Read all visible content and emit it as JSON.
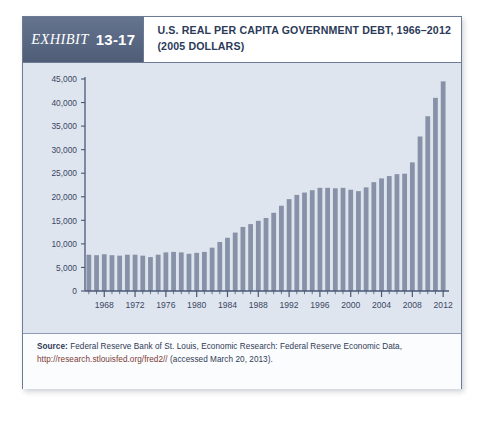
{
  "exhibit": {
    "word": "Exhibit",
    "number": "13-17"
  },
  "title": {
    "line1": "U.S. Real Per Capita Government Debt, 1966–2012",
    "line2": "(2005 Dollars)"
  },
  "source": {
    "label": "Source:",
    "text": " Federal Reserve Bank of St. Louis, Economic Research: Federal Reserve Economic Data,",
    "url": "http://research.stlouisfed.org/fred2//",
    "accessed": " (accessed March 20, 2013)."
  },
  "colors": {
    "bar": "#8792a8",
    "plot_background": "#dfe5ee",
    "axis": "#4a5875",
    "tag_background": "#5c6a86",
    "title_text": "#2b3a58",
    "url_text": "#7a3b35"
  },
  "chart_data": {
    "type": "bar",
    "title": "U.S. Real Per Capita Government Debt, 1966–2012 (2005 Dollars)",
    "xlabel": "",
    "ylabel": "",
    "ylim": [
      0,
      45000
    ],
    "ytick_step": 5000,
    "ytick_labels": [
      "0",
      "5,000",
      "10,000",
      "15,000",
      "20,000",
      "25,000",
      "30,000",
      "35,000",
      "40,000",
      "45,000"
    ],
    "ytick_values": [
      0,
      5000,
      10000,
      15000,
      20000,
      25000,
      30000,
      35000,
      40000,
      45000
    ],
    "xtick_labels": [
      "1968",
      "1972",
      "1976",
      "1980",
      "1984",
      "1988",
      "1992",
      "1996",
      "2000",
      "2004",
      "2008",
      "2012"
    ],
    "xtick_values": [
      1968,
      1972,
      1976,
      1980,
      1984,
      1988,
      1992,
      1996,
      2000,
      2004,
      2008,
      2012
    ],
    "xlim": [
      1965.5,
      2012.5
    ],
    "grid": false,
    "legend": "none",
    "categories": [
      1966,
      1967,
      1968,
      1969,
      1970,
      1971,
      1972,
      1973,
      1974,
      1975,
      1976,
      1977,
      1978,
      1979,
      1980,
      1981,
      1982,
      1983,
      1984,
      1985,
      1986,
      1987,
      1988,
      1989,
      1990,
      1991,
      1992,
      1993,
      1994,
      1995,
      1996,
      1997,
      1998,
      1999,
      2000,
      2001,
      2002,
      2003,
      2004,
      2005,
      2006,
      2007,
      2008,
      2009,
      2010,
      2011,
      2012
    ],
    "values": [
      7700,
      7600,
      7800,
      7600,
      7500,
      7700,
      7700,
      7500,
      7200,
      7700,
      8200,
      8300,
      8200,
      7900,
      8100,
      8300,
      9200,
      10400,
      11300,
      12400,
      13600,
      14200,
      14900,
      15500,
      16600,
      18100,
      19500,
      20400,
      20900,
      21400,
      21900,
      21900,
      21800,
      21900,
      21500,
      21200,
      22000,
      23100,
      23900,
      24400,
      24800,
      24900,
      27300,
      32800,
      37100,
      41000,
      44500
    ]
  }
}
